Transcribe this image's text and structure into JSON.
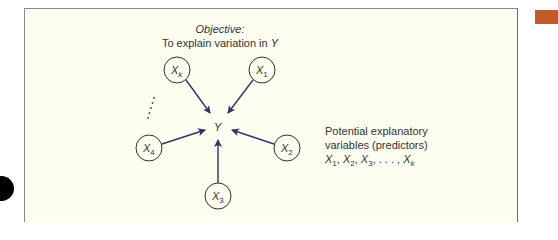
{
  "diagram": {
    "objective_label": "Objective:",
    "objective_text": "To explain variation in",
    "objective_var": "Y",
    "center_node": {
      "label": "Y",
      "x": 218,
      "y": 127
    },
    "predictor_nodes": [
      {
        "id": "xk",
        "base": "X",
        "sub": "k",
        "x": 177,
        "y": 70
      },
      {
        "id": "x1",
        "base": "X",
        "sub": "1",
        "x": 262,
        "y": 70
      },
      {
        "id": "x4",
        "base": "X",
        "sub": "4",
        "x": 149,
        "y": 148
      },
      {
        "id": "x2",
        "base": "X",
        "sub": "2",
        "x": 287,
        "y": 148
      },
      {
        "id": "x3",
        "base": "X",
        "sub": "3",
        "x": 218,
        "y": 196
      }
    ],
    "ellipsis": "⋮",
    "legend": {
      "line1": "Potential explanatory",
      "line2": "variables (predictors)",
      "list": [
        {
          "base": "X",
          "sub": "1",
          "sep": ", "
        },
        {
          "base": "X",
          "sub": "2",
          "sep": ", "
        },
        {
          "base": "X",
          "sub": "3",
          "sep": ", . . . , "
        },
        {
          "base": "X",
          "sub": "k",
          "sep": ""
        }
      ]
    },
    "colors": {
      "background": "#fdfdf0",
      "arrow": "#2e3470",
      "node_stroke": "#333333",
      "accent_tab": "#c4592a"
    }
  }
}
